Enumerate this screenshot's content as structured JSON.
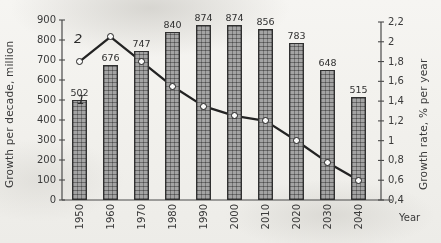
{
  "chart_data": {
    "type": "bar",
    "title": "",
    "xlabel": "Year",
    "ylabel": "Growth per decade, million",
    "y2label": "Growth rate, % per year",
    "categories": [
      "1950",
      "1960",
      "1970",
      "1980",
      "1990",
      "2000",
      "2010",
      "2020",
      "2030",
      "2040"
    ],
    "ylim": [
      0,
      900
    ],
    "y2lim": [
      0.4,
      2.2
    ],
    "yticks": [
      "0",
      "100",
      "200",
      "300",
      "400",
      "500",
      "600",
      "700",
      "800",
      "900"
    ],
    "y2ticks": [
      "0,4",
      "0,6",
      "0,8",
      "1",
      "1,2",
      "1,4",
      "1,6",
      "1,8",
      "2",
      "2,2"
    ],
    "grid": false,
    "legend_position": "inline-annotation",
    "series": [
      {
        "name": "1",
        "type": "bar",
        "axis": "left",
        "unit": "million per decade",
        "values": [
          502,
          676,
          747,
          840,
          874,
          874,
          856,
          783,
          648,
          515
        ],
        "labels": [
          "502",
          "676",
          "747",
          "840",
          "874",
          "874",
          "856",
          "783",
          "648",
          "515"
        ]
      },
      {
        "name": "2",
        "type": "line",
        "axis": "right",
        "unit": "% per year",
        "values": [
          1.8,
          2.05,
          1.8,
          1.55,
          1.35,
          1.25,
          1.2,
          1.0,
          0.78,
          0.6
        ],
        "labels": [
          "",
          "",
          "",
          "",
          "",
          "",
          "",
          "",
          "",
          ""
        ]
      }
    ],
    "annotations": [
      {
        "text": "1",
        "series": "bars",
        "near_category": "1950"
      },
      {
        "text": "2",
        "series": "line",
        "near_category": "1950"
      }
    ]
  },
  "axes": {
    "left_title": "Growth per decade, million",
    "right_title": "Growth rate, % per year",
    "x_title": "Year"
  }
}
